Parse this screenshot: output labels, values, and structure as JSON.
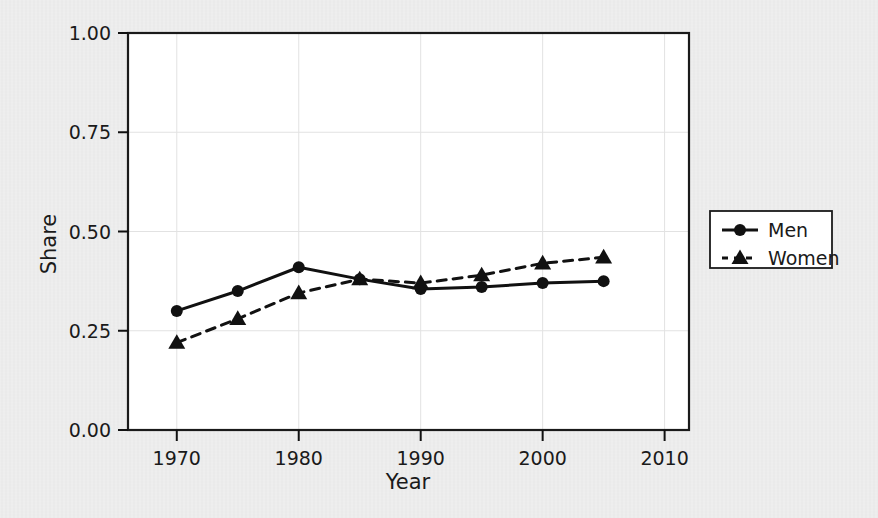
{
  "figure": {
    "background_color": "#ebebeb",
    "plot_background_color": "#ffffff",
    "ink_color": "#111111",
    "grid_color": "#e2e2e2"
  },
  "chart_data": {
    "type": "line",
    "title": "",
    "xlabel": "Year",
    "ylabel": "Share",
    "xlim": [
      1966,
      2012
    ],
    "ylim": [
      0.0,
      1.0
    ],
    "grid": true,
    "legend_position": "right",
    "x": [
      1970,
      1975,
      1980,
      1985,
      1990,
      1995,
      2000,
      2005
    ],
    "xticks": [
      1970,
      1980,
      1990,
      2000,
      2010
    ],
    "xtick_labels": [
      "1970",
      "1980",
      "1990",
      "2000",
      "2010"
    ],
    "yticks": [
      0.0,
      0.25,
      0.5,
      0.75,
      1.0
    ],
    "ytick_labels": [
      "0.00",
      "0.25",
      "0.50",
      "0.75",
      "1.00"
    ],
    "series": [
      {
        "name": "Men",
        "marker": "circle",
        "linestyle": "solid",
        "color": "#111111",
        "values": [
          0.3,
          0.35,
          0.41,
          0.38,
          0.355,
          0.36,
          0.37,
          0.375
        ]
      },
      {
        "name": "Women",
        "marker": "triangle",
        "linestyle": "dashed",
        "color": "#111111",
        "values": [
          0.22,
          0.28,
          0.345,
          0.38,
          0.37,
          0.39,
          0.42,
          0.435
        ]
      }
    ]
  },
  "legend": {
    "entries": [
      {
        "label": "Men"
      },
      {
        "label": "Women"
      }
    ]
  }
}
